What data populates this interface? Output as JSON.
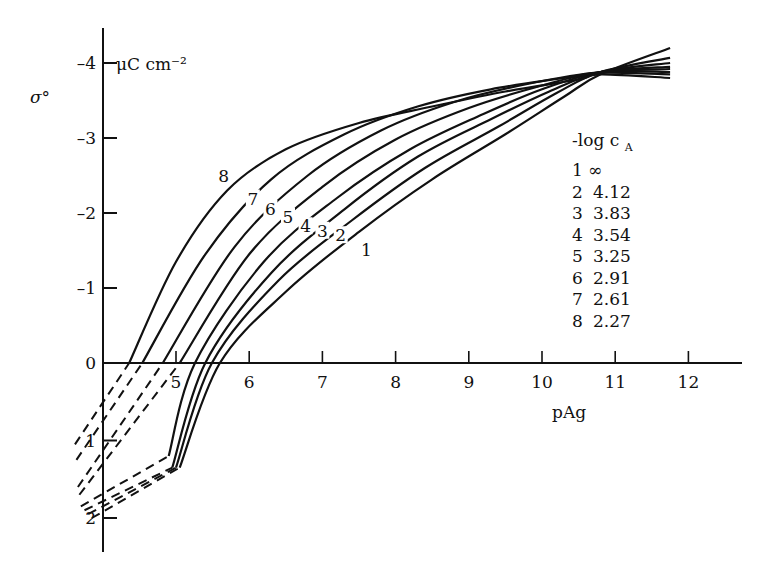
{
  "chart_data": {
    "type": "line",
    "title": "",
    "xlabel": "pAg",
    "ylabel": "σ°",
    "yunit": "μC cm⁻²",
    "xlim": [
      3.6,
      12.7
    ],
    "ylim": [
      2.4,
      -4.4
    ],
    "y_inverted": true,
    "grid": false,
    "x_ticks": [
      5,
      6,
      7,
      8,
      9,
      10,
      11,
      12
    ],
    "y_ticks": [
      -4,
      -3,
      -2,
      -1,
      0,
      1,
      2
    ],
    "y_tick_labels": [
      "-4",
      "-3",
      "-2",
      "-1",
      "0",
      "1",
      "2"
    ],
    "legend_title": "-log c",
    "legend_title_sub": "A",
    "legend_position": "right",
    "legend": [
      {
        "id": "1",
        "value": "∞"
      },
      {
        "id": "2",
        "value": "4.12"
      },
      {
        "id": "3",
        "value": "3.83"
      },
      {
        "id": "4",
        "value": "3.54"
      },
      {
        "id": "5",
        "value": "3.25"
      },
      {
        "id": "6",
        "value": "2.91"
      },
      {
        "id": "7",
        "value": "2.61"
      },
      {
        "id": "8",
        "value": "2.27"
      }
    ],
    "series": [
      {
        "name": "1",
        "neg_log_cA": "∞",
        "x": [
          5.05,
          5.6,
          6.5,
          7.5,
          8.5,
          9.5,
          10.3,
          10.8,
          11.75
        ],
        "y": [
          1.35,
          0,
          -0.95,
          -1.75,
          -2.45,
          -3.05,
          -3.55,
          -3.85,
          -4.2
        ],
        "dashed_x": [
          3.85,
          5.05
        ],
        "dashed_y": [
          2.0,
          1.35
        ],
        "label_pos": [
          7.6,
          -1.45
        ]
      },
      {
        "name": "2",
        "neg_log_cA": "4.12",
        "x": [
          5.0,
          5.49,
          6.4,
          7.4,
          8.4,
          9.4,
          10.2,
          10.8,
          11.75
        ],
        "y": [
          1.35,
          0,
          -1.1,
          -1.9,
          -2.6,
          -3.15,
          -3.6,
          -3.88,
          -4.07
        ],
        "dashed_x": [
          3.8,
          5.0
        ],
        "dashed_y": [
          1.95,
          1.35
        ],
        "label_pos": [
          7.25,
          -1.65
        ]
      },
      {
        "name": "3",
        "neg_log_cA": "3.83",
        "x": [
          4.95,
          5.4,
          6.3,
          7.3,
          8.3,
          9.3,
          10.1,
          10.8,
          11.75
        ],
        "y": [
          1.35,
          0,
          -1.2,
          -2.05,
          -2.75,
          -3.25,
          -3.62,
          -3.88,
          -4.0
        ],
        "dashed_x": [
          3.75,
          4.95
        ],
        "dashed_y": [
          1.9,
          1.35
        ],
        "label_pos": [
          7.0,
          -1.71
        ]
      },
      {
        "name": "4",
        "neg_log_cA": "3.54",
        "x": [
          4.9,
          5.26,
          6.2,
          7.2,
          8.2,
          9.2,
          10.0,
          10.8,
          11.75
        ],
        "y": [
          1.2,
          0,
          -1.35,
          -2.2,
          -2.85,
          -3.32,
          -3.65,
          -3.88,
          -3.95
        ],
        "dashed_x": [
          3.7,
          4.9
        ],
        "dashed_y": [
          1.85,
          1.2
        ],
        "label_pos": [
          6.77,
          -1.77
        ]
      },
      {
        "name": "5",
        "neg_log_cA": "3.25",
        "x": [
          5.05,
          6.0,
          7.0,
          8.0,
          9.0,
          10.0,
          10.8,
          11.75
        ],
        "y": [
          0,
          -1.45,
          -2.35,
          -2.98,
          -3.4,
          -3.7,
          -3.88,
          -3.92
        ],
        "dashed_x": [
          3.68,
          5.05
        ],
        "dashed_y": [
          1.7,
          0
        ],
        "label_pos": [
          6.53,
          -1.9
        ]
      },
      {
        "name": "6",
        "neg_log_cA": "2.91",
        "x": [
          4.82,
          5.8,
          6.8,
          7.8,
          8.8,
          9.8,
          10.8,
          11.75
        ],
        "y": [
          0,
          -1.55,
          -2.5,
          -3.1,
          -3.48,
          -3.72,
          -3.88,
          -3.88
        ],
        "dashed_x": [
          3.66,
          4.82
        ],
        "dashed_y": [
          1.6,
          0
        ],
        "label_pos": [
          6.29,
          -2.0
        ]
      },
      {
        "name": "7",
        "neg_log_cA": "2.61",
        "x": [
          4.54,
          5.4,
          6.3,
          7.3,
          8.3,
          9.3,
          10.3,
          10.8,
          11.75
        ],
        "y": [
          0,
          -1.45,
          -2.45,
          -3.05,
          -3.42,
          -3.65,
          -3.8,
          -3.87,
          -3.85
        ],
        "dashed_x": [
          3.64,
          4.54
        ],
        "dashed_y": [
          1.25,
          0
        ],
        "label_pos": [
          6.05,
          -2.14
        ]
      },
      {
        "name": "8",
        "neg_log_cA": "2.27",
        "x": [
          4.36,
          5.0,
          5.7,
          6.5,
          7.5,
          8.5,
          9.5,
          10.5,
          10.8,
          11.75
        ],
        "y": [
          0,
          -1.35,
          -2.3,
          -2.85,
          -3.2,
          -3.42,
          -3.62,
          -3.78,
          -3.85,
          -3.8
        ],
        "dashed_x": [
          3.62,
          4.36
        ],
        "dashed_y": [
          1.05,
          0
        ],
        "label_pos": [
          5.65,
          -2.44
        ]
      }
    ]
  }
}
